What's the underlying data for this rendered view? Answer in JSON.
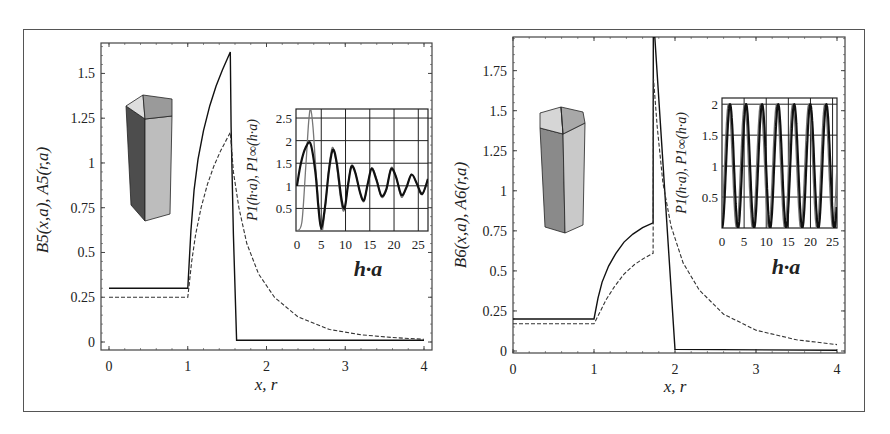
{
  "colors": {
    "curve_solid": "#111111",
    "curve_dashed": "#333333",
    "frame": "#444444",
    "grid": "#222222",
    "inset_thin": "#777777"
  },
  "chart_data": [
    {
      "id": "left-main",
      "type": "line",
      "title": "",
      "xlabel": "x, r",
      "ylabel": "B5(x,a),  A5(r,a)",
      "xlim": [
        0,
        4
      ],
      "ylim": [
        0,
        1.67
      ],
      "xticks": [
        "0",
        "1",
        "2",
        "3",
        "4"
      ],
      "yticks": [
        "0",
        "0.25",
        "0.5",
        "0.75",
        "1",
        "1.25",
        "1.5"
      ],
      "grid": false,
      "icon": "pentagonal-prism",
      "series": [
        {
          "name": "B5(x,a)",
          "style": "solid",
          "points": [
            [
              0,
              0.3
            ],
            [
              1.0,
              0.3
            ],
            [
              1.04,
              0.62
            ],
            [
              1.08,
              0.85
            ],
            [
              1.13,
              1.02
            ],
            [
              1.2,
              1.18
            ],
            [
              1.28,
              1.32
            ],
            [
              1.36,
              1.43
            ],
            [
              1.44,
              1.52
            ],
            [
              1.54,
              1.62
            ],
            [
              1.55,
              1.2
            ],
            [
              1.58,
              0.6
            ],
            [
              1.62,
              0.01
            ],
            [
              4.0,
              0.01
            ]
          ]
        },
        {
          "name": "A5(r,a)",
          "style": "dashed",
          "points": [
            [
              0,
              0.25
            ],
            [
              1.0,
              0.25
            ],
            [
              1.05,
              0.45
            ],
            [
              1.1,
              0.6
            ],
            [
              1.17,
              0.75
            ],
            [
              1.25,
              0.88
            ],
            [
              1.33,
              0.98
            ],
            [
              1.42,
              1.07
            ],
            [
              1.54,
              1.17
            ],
            [
              1.58,
              0.95
            ],
            [
              1.65,
              0.75
            ],
            [
              1.75,
              0.55
            ],
            [
              1.9,
              0.38
            ],
            [
              2.1,
              0.25
            ],
            [
              2.4,
              0.14
            ],
            [
              2.8,
              0.07
            ],
            [
              3.2,
              0.04
            ],
            [
              3.6,
              0.025
            ],
            [
              4.0,
              0.015
            ]
          ]
        }
      ]
    },
    {
      "id": "left-inset",
      "type": "line",
      "xlabel": "h·a",
      "ylabel": "P1(h·a),  P1∞(h·a)",
      "xlim": [
        0,
        27
      ],
      "ylim": [
        0,
        2.7
      ],
      "xticks": [
        "0",
        "5",
        "10",
        "15",
        "20",
        "25"
      ],
      "yticks": [
        "0.5",
        "1",
        "1.5",
        "2",
        "2.5"
      ],
      "grid": true,
      "series": [
        {
          "name": "P1(h·a)",
          "style": "thin",
          "points": [
            [
              0,
              0
            ],
            [
              1,
              0.2
            ],
            [
              1.8,
              1.4
            ],
            [
              2.4,
              2.4
            ],
            [
              2.8,
              2.7
            ],
            [
              3.3,
              2.3
            ],
            [
              4,
              1.2
            ],
            [
              5,
              0.0
            ],
            [
              5.8,
              0.5
            ],
            [
              6.6,
              1.4
            ],
            [
              7.3,
              1.85
            ],
            [
              8.1,
              1.5
            ],
            [
              9,
              0.7
            ],
            [
              9.7,
              0.45
            ],
            [
              10.5,
              1.0
            ],
            [
              11.2,
              1.45
            ],
            [
              12,
              1.3
            ],
            [
              13,
              0.85
            ],
            [
              13.8,
              0.65
            ],
            [
              14.6,
              1.05
            ],
            [
              15.4,
              1.4
            ],
            [
              16.4,
              1.15
            ],
            [
              17.4,
              0.75
            ],
            [
              18.4,
              0.9
            ],
            [
              19.4,
              1.4
            ],
            [
              20.4,
              1.2
            ],
            [
              21.5,
              0.75
            ],
            [
              22.5,
              0.95
            ],
            [
              23.6,
              1.25
            ],
            [
              24.7,
              1.05
            ],
            [
              25.8,
              0.8
            ],
            [
              27,
              1.15
            ]
          ]
        },
        {
          "name": "P1∞(h·a)",
          "style": "thick",
          "points": [
            [
              0,
              1.0
            ],
            [
              0.8,
              1.5
            ],
            [
              1.8,
              1.85
            ],
            [
              2.8,
              1.93
            ],
            [
              3.8,
              1.3
            ],
            [
              4.4,
              0.55
            ],
            [
              5.0,
              0.05
            ],
            [
              5.8,
              0.55
            ],
            [
              6.6,
              1.35
            ],
            [
              7.4,
              1.8
            ],
            [
              8.2,
              1.5
            ],
            [
              9.1,
              0.75
            ],
            [
              9.8,
              0.5
            ],
            [
              10.5,
              1.0
            ],
            [
              11.2,
              1.42
            ],
            [
              12,
              1.3
            ],
            [
              13,
              0.85
            ],
            [
              13.8,
              0.68
            ],
            [
              14.6,
              1.05
            ],
            [
              15.4,
              1.38
            ],
            [
              16.4,
              1.12
            ],
            [
              17.4,
              0.78
            ],
            [
              18.4,
              0.92
            ],
            [
              19.4,
              1.37
            ],
            [
              20.4,
              1.2
            ],
            [
              21.5,
              0.8
            ],
            [
              22.5,
              0.95
            ],
            [
              23.6,
              1.25
            ],
            [
              24.7,
              1.05
            ],
            [
              25.8,
              0.82
            ],
            [
              27,
              1.15
            ]
          ]
        }
      ]
    },
    {
      "id": "right-main",
      "type": "line",
      "title": "",
      "xlabel": "x, r",
      "ylabel": "B6(x,a),  A6(r,a)",
      "xlim": [
        0,
        4
      ],
      "ylim": [
        0,
        1.96
      ],
      "xticks": [
        "0",
        "1",
        "2",
        "3",
        "4"
      ],
      "yticks": [
        "0",
        "0.25",
        "0.5",
        "0.75",
        "1",
        "1.25",
        "1.5",
        "1.75"
      ],
      "grid": false,
      "icon": "hexagonal-prism",
      "series": [
        {
          "name": "B6(x,a)",
          "style": "solid",
          "points": [
            [
              0,
              0.2
            ],
            [
              1.0,
              0.2
            ],
            [
              1.05,
              0.33
            ],
            [
              1.1,
              0.43
            ],
            [
              1.18,
              0.53
            ],
            [
              1.27,
              0.61
            ],
            [
              1.37,
              0.68
            ],
            [
              1.48,
              0.73
            ],
            [
              1.6,
              0.77
            ],
            [
              1.73,
              0.8
            ],
            [
              1.732,
              1.96
            ],
            [
              1.75,
              1.96
            ],
            [
              2.0,
              0.01
            ],
            [
              4.0,
              0.005
            ]
          ]
        },
        {
          "name": "A6(r,a)",
          "style": "dashed",
          "points": [
            [
              0,
              0.17
            ],
            [
              1.0,
              0.17
            ],
            [
              1.07,
              0.24
            ],
            [
              1.15,
              0.32
            ],
            [
              1.25,
              0.4
            ],
            [
              1.37,
              0.48
            ],
            [
              1.5,
              0.54
            ],
            [
              1.62,
              0.58
            ],
            [
              1.73,
              0.61
            ],
            [
              1.735,
              1.7
            ],
            [
              1.78,
              1.4
            ],
            [
              1.85,
              1.05
            ],
            [
              1.95,
              0.78
            ],
            [
              2.1,
              0.55
            ],
            [
              2.3,
              0.38
            ],
            [
              2.6,
              0.23
            ],
            [
              3.0,
              0.13
            ],
            [
              3.5,
              0.07
            ],
            [
              4.0,
              0.04
            ]
          ]
        }
      ]
    },
    {
      "id": "right-inset",
      "type": "line",
      "xlabel": "h·a",
      "ylabel": "P1(h·a), P1∞(h·a)",
      "xlim": [
        0,
        26
      ],
      "ylim": [
        0,
        2.1
      ],
      "xticks": [
        "0",
        "5",
        "10",
        "15",
        "20",
        "25"
      ],
      "yticks": [
        "0.5",
        "1",
        "1.5",
        "2"
      ],
      "grid": true,
      "series": [
        {
          "name": "P1(h·a)",
          "style": "thin",
          "period": 3.63,
          "phase": -0.35,
          "amplitude": 1.0,
          "offset": 1.0
        },
        {
          "name": "P1∞(h·a)",
          "style": "thick",
          "period": 3.63,
          "phase": 0.0,
          "amplitude": 1.0,
          "offset": 1.0
        }
      ]
    }
  ],
  "layout": {
    "left-main": {
      "x0": 109,
      "x1": 424,
      "y0": 342,
      "y1": 43,
      "frame": [
        101,
        43,
        432,
        350
      ]
    },
    "left-inset": {
      "x0": 297,
      "x1": 428,
      "y0": 231,
      "y1": 109,
      "frame": [
        296,
        109,
        428,
        231
      ]
    },
    "right-main": {
      "x0": 513,
      "x1": 837,
      "y0": 351,
      "y1": 37,
      "frame": [
        513,
        37,
        845,
        353
      ]
    },
    "right-inset": {
      "x0": 722,
      "x1": 837,
      "y0": 228,
      "y1": 98,
      "frame": [
        722,
        98,
        837,
        228
      ]
    }
  }
}
